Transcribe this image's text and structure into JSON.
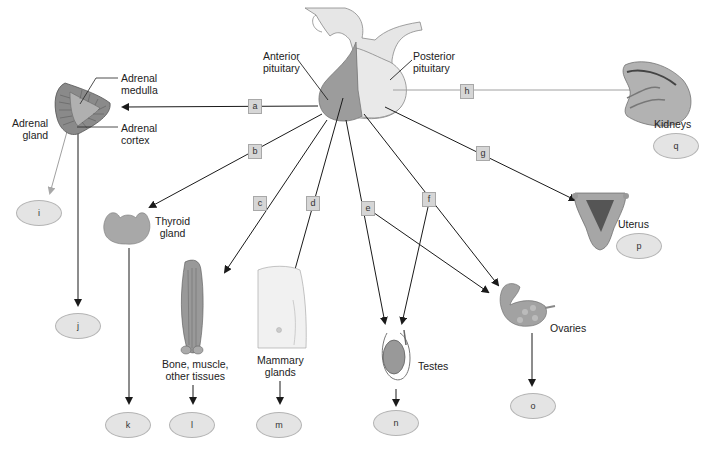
{
  "pituitary": {
    "anterior_label": "Anterior pituitary",
    "anterior_l1": "Anterior",
    "anterior_l2": "pituitary",
    "posterior_l1": "Posterior",
    "posterior_l2": "pituitary",
    "anterior_color": "#9a9a9a",
    "posterior_color": "#e6e6e6"
  },
  "hormone_boxes": [
    {
      "id": "a",
      "label": "a"
    },
    {
      "id": "b",
      "label": "b"
    },
    {
      "id": "c",
      "label": "c"
    },
    {
      "id": "d",
      "label": "d"
    },
    {
      "id": "e",
      "label": "e"
    },
    {
      "id": "f",
      "label": "f"
    },
    {
      "id": "g",
      "label": "g"
    },
    {
      "id": "h",
      "label": "h"
    }
  ],
  "targets": {
    "adrenal_gland": {
      "l1": "Adrenal",
      "l2": "gland"
    },
    "adrenal_medulla": {
      "l1": "Adrenal",
      "l2": "medulla"
    },
    "adrenal_cortex": {
      "l1": "Adrenal",
      "l2": "cortex"
    },
    "thyroid": {
      "l1": "Thyroid",
      "l2": "gland"
    },
    "bone_muscle": {
      "l1": "Bone, muscle,",
      "l2": "other tissues"
    },
    "mammary": {
      "l1": "Mammary",
      "l2": "glands"
    },
    "testes": {
      "l1": "Testes"
    },
    "ovaries": {
      "l1": "Ovaries"
    },
    "uterus": {
      "l1": "Uterus"
    },
    "kidneys": {
      "l1": "Kidneys"
    }
  },
  "answer_ovals": [
    {
      "id": "i",
      "label": "i"
    },
    {
      "id": "j",
      "label": "j"
    },
    {
      "id": "k",
      "label": "k"
    },
    {
      "id": "l",
      "label": "l"
    },
    {
      "id": "m",
      "label": "m"
    },
    {
      "id": "n",
      "label": "n"
    },
    {
      "id": "o",
      "label": "o"
    },
    {
      "id": "p",
      "label": "p"
    },
    {
      "id": "q",
      "label": "q"
    }
  ],
  "colors": {
    "arrow_dark": "#1a1a1a",
    "arrow_gray": "#a0a0a0",
    "box_fill": "#d6d6d6",
    "oval_fill": "#e4e4e4"
  }
}
